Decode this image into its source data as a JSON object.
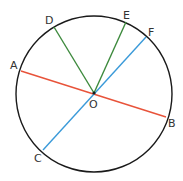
{
  "diagram": {
    "type": "circle-geometry",
    "circle": {
      "cx": 94,
      "cy": 94,
      "r": 78,
      "stroke": "#1a1a1a"
    },
    "center": {
      "label": "O",
      "x": 94,
      "y": 93
    },
    "points": {
      "A": {
        "label": "A",
        "x": 21,
        "y": 71
      },
      "B": {
        "label": "B",
        "x": 166,
        "y": 117
      },
      "C": {
        "label": "C",
        "x": 43,
        "y": 150
      },
      "D": {
        "label": "D",
        "x": 54,
        "y": 27
      },
      "E": {
        "label": "E",
        "x": 126,
        "y": 22
      },
      "F": {
        "label": "F",
        "x": 146,
        "y": 37
      }
    },
    "segments": [
      {
        "name": "diameter-AB",
        "from": "A",
        "to": "B",
        "color": "#e8533a"
      },
      {
        "name": "diameter-CF",
        "from": "C",
        "to": "F",
        "color": "#3a9ad9"
      },
      {
        "name": "radius-OD",
        "from": "O",
        "to": "D",
        "color": "#3d8a3d"
      },
      {
        "name": "radius-OE",
        "from": "O",
        "to": "E",
        "color": "#3d8a3d"
      }
    ]
  }
}
